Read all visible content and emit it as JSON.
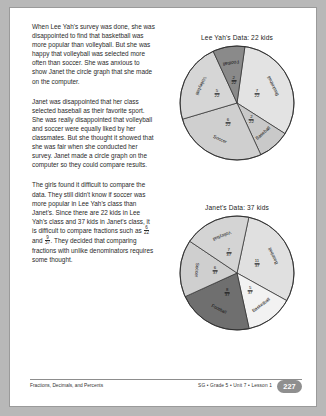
{
  "footer": {
    "left_text": "Fractions, Decimals, and Percents",
    "right_text": "SG • Grade 5 • Unit 7 • Lesson 1",
    "page_number": "227"
  },
  "body_text": {
    "paragraph_1": "When Lee Yah's survey was done, she was disappointed to find that basketball was more popular than volleyball. But she was happy that volleyball was selected more often than soccer. She was anxious to show Janet the circle graph that she made on the computer.",
    "paragraph_2": "Janet was disappointed that her class selected baseball as their favorite sport. She was really disappointed that volleyball and soccer were equally liked by her classmates. But she thought it showed that she was fair when she conducted her survey. Janet made a circle graph on the computer so they could compare results.",
    "paragraph_3_part1": "The girls found it difficult to compare the data. They still didn't know if soccer was more popular in Lee Yah's class than Janet's. Since there are 22 kids in Lee Yah's class and 37 kids in Janet's class, it is difficult to compare fractions such as ",
    "paragraph_3_frac1_num": "6",
    "paragraph_3_frac1_den": "22",
    "paragraph_3_and": " and ",
    "paragraph_3_frac2_num": "9",
    "paragraph_3_frac2_den": "37",
    "paragraph_3_part2": ". They decided that comparing fractions with unlike denominators requires some thought."
  },
  "chart_data": [
    {
      "type": "pie",
      "title": "Lee Yah's Data: 22 kids",
      "total": 22,
      "unit": "kids",
      "categories": [
        "Basketball",
        "Baseball",
        "Soccer",
        "Volleyball",
        "Football"
      ],
      "values": [
        7,
        2,
        6,
        5,
        2
      ],
      "fractions": [
        "7/22",
        "2/22",
        "6/22",
        "5/22",
        "2/22"
      ],
      "colors": [
        "#e3e3e3",
        "#c9c9c9",
        "#cfcfcf",
        "#d6d6d6",
        "#8a8a8a"
      ],
      "legend": "none",
      "grid": false
    },
    {
      "type": "pie",
      "title": "Janet's Data: 37 kids",
      "total": 37,
      "unit": "kids",
      "categories": [
        "Baseball",
        "Basketball",
        "Football",
        "Soccer",
        "Volleyball"
      ],
      "values": [
        11,
        5,
        8,
        6,
        7
      ],
      "fractions": [
        "11/37",
        "5/37",
        "8/37",
        "6/37",
        "7/37"
      ],
      "colors": [
        "#e0e0e0",
        "#f2f2f2",
        "#6f6f6f",
        "#cfcfcf",
        "#d4d4d4"
      ],
      "legend": "none",
      "grid": false
    }
  ]
}
